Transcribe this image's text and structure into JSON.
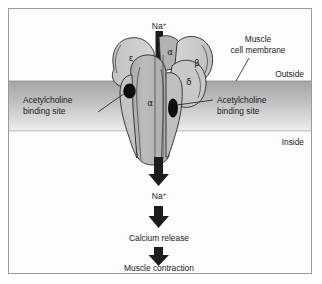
{
  "figure": {
    "border_color": "#9a9a9a",
    "background": "#ffffff"
  },
  "membrane": {
    "label": "Muscle\ncell membrane",
    "label_line1": "Muscle",
    "label_line2": "cell membrane",
    "outside_label": "Outside",
    "inside_label": "Inside",
    "top_color": "#a9a9a9",
    "bottom_color": "#e8e8e8"
  },
  "receptor": {
    "subunits": [
      {
        "name": "epsilon",
        "symbol": "ε",
        "fill": "#cdcdcd"
      },
      {
        "name": "alpha-top",
        "symbol": "α",
        "fill": "#b9b9b9"
      },
      {
        "name": "beta",
        "symbol": "β",
        "fill": "#cdcdcd"
      },
      {
        "name": "delta",
        "symbol": "δ",
        "fill": "#c6c6c6"
      },
      {
        "name": "alpha-front",
        "symbol": "α",
        "fill": "#b5b5b5"
      }
    ],
    "binding_sites": [
      {
        "name": "left-binding-site",
        "label_line1": "Acetylcholine",
        "label_line2": "binding site",
        "color": "#111111"
      },
      {
        "name": "right-binding-site",
        "label_line1": "Acetylcholine",
        "label_line2": "binding site",
        "color": "#111111"
      }
    ]
  },
  "cascade": {
    "ion_symbol": "Na",
    "ion_charge": "+",
    "top_ion_label": "Na",
    "lower_ion_label": "Na",
    "steps": [
      {
        "name": "sodium-influx-top",
        "label": "Na+"
      },
      {
        "name": "sodium-influx-bottom",
        "label": "Na+"
      },
      {
        "name": "calcium-release",
        "label": "Calcium release"
      },
      {
        "name": "muscle-contraction",
        "label": "Muscle contraction"
      }
    ],
    "calcium_release_label": "Calcium release",
    "muscle_contraction_label": "Muscle contraction",
    "arrow_color": "#1c1c1c"
  }
}
